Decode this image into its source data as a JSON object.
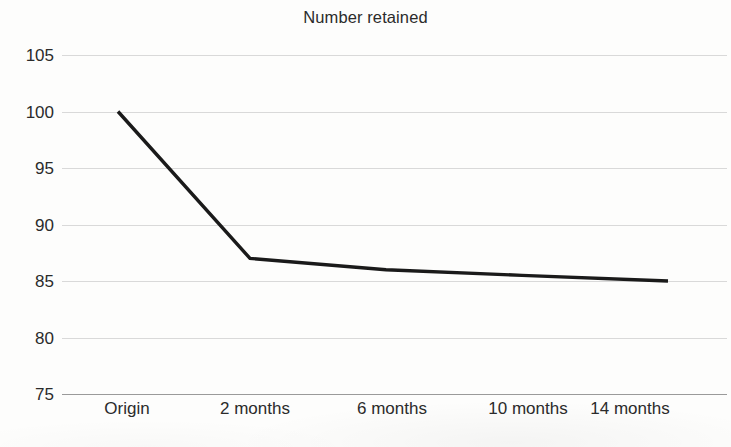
{
  "chart_data": {
    "type": "line",
    "title": "Number retained",
    "xlabel": "",
    "ylabel": "",
    "categories": [
      "Origin",
      "2 months",
      "6 months",
      "10 months",
      "14 months"
    ],
    "values": [
      100,
      87,
      86,
      85.5,
      85
    ],
    "series": [
      {
        "name": "Number retained",
        "values": [
          100,
          87,
          86,
          85.5,
          85
        ],
        "color": "#1a1a1a"
      }
    ],
    "ylim": [
      75,
      105
    ],
    "yticks": [
      105,
      100,
      95,
      90,
      85,
      80,
      75
    ],
    "ytick_labels": [
      "105",
      "100",
      "95",
      "90",
      "85",
      "80",
      "75"
    ],
    "xtick_labels": [
      "Origin",
      "2 months",
      "6 months",
      "10 months",
      "14 months"
    ],
    "grid": true,
    "grid_axis": "y",
    "legend": false,
    "legend_position": "none",
    "line_color": "#1a1a1a",
    "grid_color": "#d2d2d2",
    "axis_color": "#9a9a9a",
    "background_color": "#ffffff",
    "text_color": "#2b2b2b",
    "annotations": []
  }
}
